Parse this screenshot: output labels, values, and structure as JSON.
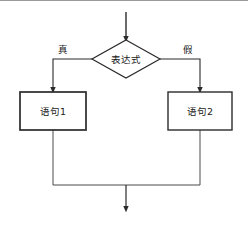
{
  "diagram": {
    "language": "zh",
    "background_color": "#ffffff",
    "line_color": "#2b2b2b",
    "text_color": "#1a1a1a",
    "top_rule_color": "#9a9a9a"
  },
  "nodes": {
    "decision": {
      "label": "表达式",
      "shape": "diamond",
      "cx": 126,
      "cy": 59,
      "half_width": 34,
      "half_height": 19
    },
    "true_statement": {
      "label": "语句1",
      "shape": "rect",
      "x": 20,
      "y": 92,
      "width": 66,
      "height": 38
    },
    "false_statement": {
      "label": "语句2",
      "shape": "rect",
      "x": 168,
      "y": 92,
      "width": 64,
      "height": 38
    }
  },
  "edges": {
    "entry": {
      "label": "",
      "from_x": 126,
      "from_y": 12,
      "to_x": 126,
      "to_y": 40
    },
    "true_branch": {
      "label": "真",
      "label_x": 63,
      "label_y": 50,
      "path": "M 93 59 L 53 59 L 53 92"
    },
    "false_branch": {
      "label": "假",
      "label_x": 188,
      "label_y": 50,
      "path": "M 160 59 L 200 59 L 200 92"
    },
    "true_merge": {
      "label": "",
      "path": "M 53 130 L 53 185 L 126 185"
    },
    "false_merge": {
      "label": "",
      "path": "M 200 130 L 200 185 L 126 185"
    },
    "exit": {
      "label": "",
      "from_x": 126,
      "from_y": 185,
      "to_x": 126,
      "to_y": 211
    }
  }
}
